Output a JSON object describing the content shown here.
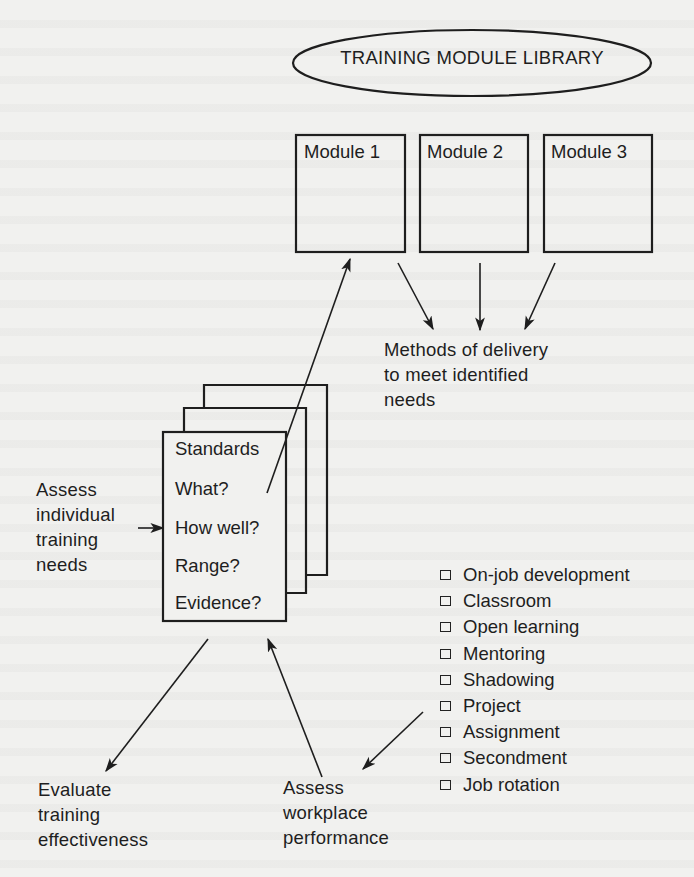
{
  "library": {
    "title": "TRAINING MODULE LIBRARY"
  },
  "modules": [
    {
      "label": "Module 1"
    },
    {
      "label": "Module 2"
    },
    {
      "label": "Module 3"
    }
  ],
  "delivery": {
    "lines": [
      "Methods of delivery",
      "to meet identified",
      "needs"
    ]
  },
  "standards_card": {
    "items": [
      "Standards",
      "What?",
      "How well?",
      "Range?",
      "Evidence?"
    ]
  },
  "assess_individual": {
    "lines": [
      "Assess",
      "individual",
      "training",
      "needs"
    ]
  },
  "evaluate": {
    "lines": [
      "Evaluate",
      "training",
      "effectiveness"
    ]
  },
  "assess_workplace": {
    "lines": [
      "Assess",
      "workplace",
      "performance"
    ]
  },
  "delivery_methods": {
    "items": [
      "On-job development",
      "Classroom",
      "Open learning",
      "Mentoring",
      "Shadowing",
      "Project",
      "Assignment",
      "Secondment",
      "Job rotation"
    ]
  },
  "colors": {
    "ink": "#1e1e1e",
    "paper": "#f1f1ef"
  }
}
